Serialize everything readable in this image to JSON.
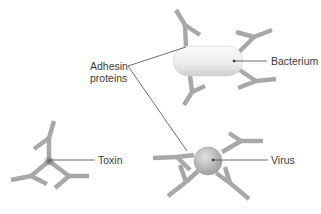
{
  "diagram": {
    "labels": {
      "adhesin_line1": "Adhesin",
      "adhesin_line2": "proteins",
      "bacterium": "Bacterium",
      "toxin": "Toxin",
      "virus": "Virus"
    },
    "colors": {
      "antibody": "#a8a8a8",
      "bacterium_fill": "#eeeeee",
      "virus_fill": "#bdbdbd",
      "toxin_core": "#6f6f6f",
      "leader_line": "#4a4a4a",
      "text": "#3a3a3a"
    },
    "elements": [
      "antibodies bound to bacterium",
      "antibodies bound to virus",
      "antibodies bound to toxin"
    ]
  }
}
